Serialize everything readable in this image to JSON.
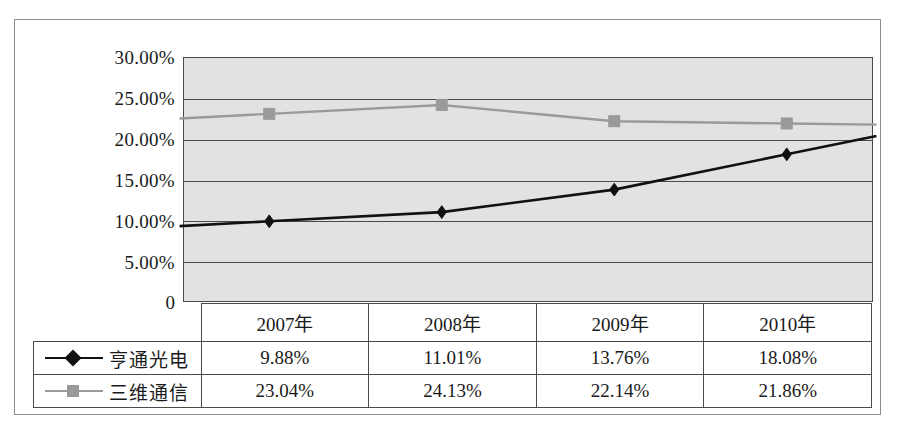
{
  "chart_data": {
    "type": "line",
    "title": "",
    "subtitle": "",
    "xlabel": "",
    "ylabel": "",
    "categories": [
      "2007年",
      "2008年",
      "2009年",
      "2010年"
    ],
    "ylim": [
      0,
      30
    ],
    "ytick_values": [
      30,
      25,
      20,
      15,
      10,
      5,
      0
    ],
    "ytick_labels": [
      "30.00%",
      "25.00%",
      "20.00%",
      "15.00%",
      "10.00%",
      "5.00%",
      "0"
    ],
    "grid": true,
    "legend_position": "data-table-left-column",
    "series": [
      {
        "name": "亨通光电",
        "marker": "diamond",
        "color": "#111111",
        "values": [
          9.88,
          11.01,
          13.76,
          18.08
        ],
        "value_labels": [
          "9.88%",
          "11.01%",
          "13.76%",
          "18.08%"
        ]
      },
      {
        "name": "三维通信",
        "marker": "square",
        "color": "#9a9a9a",
        "values": [
          23.04,
          24.13,
          22.14,
          21.86
        ],
        "value_labels": [
          "23.04%",
          "24.13%",
          "22.14%",
          "21.86%"
        ]
      }
    ],
    "colors": {
      "plot_background": "#e2e2e2",
      "axis": "#4a4a4a",
      "series_1": "#111111",
      "series_2": "#9a9a9a",
      "page_background": "#ffffff"
    }
  },
  "table": {
    "corner_label": "",
    "header": [
      "",
      "2007年",
      "2008年",
      "2009年",
      "2010年"
    ],
    "rows": [
      {
        "label": "亨通光电",
        "marker": "diamond",
        "values": [
          "9.88%",
          "11.01%",
          "13.76%",
          "18.08%"
        ]
      },
      {
        "label": "三维通信",
        "marker": "square",
        "values": [
          "23.04%",
          "24.13%",
          "22.14%",
          "21.86%"
        ]
      }
    ]
  },
  "axis": {
    "zero_label": "0",
    "ticks": [
      "30.00%",
      "25.00%",
      "20.00%",
      "15.00%",
      "10.00%",
      "5.00%"
    ]
  }
}
